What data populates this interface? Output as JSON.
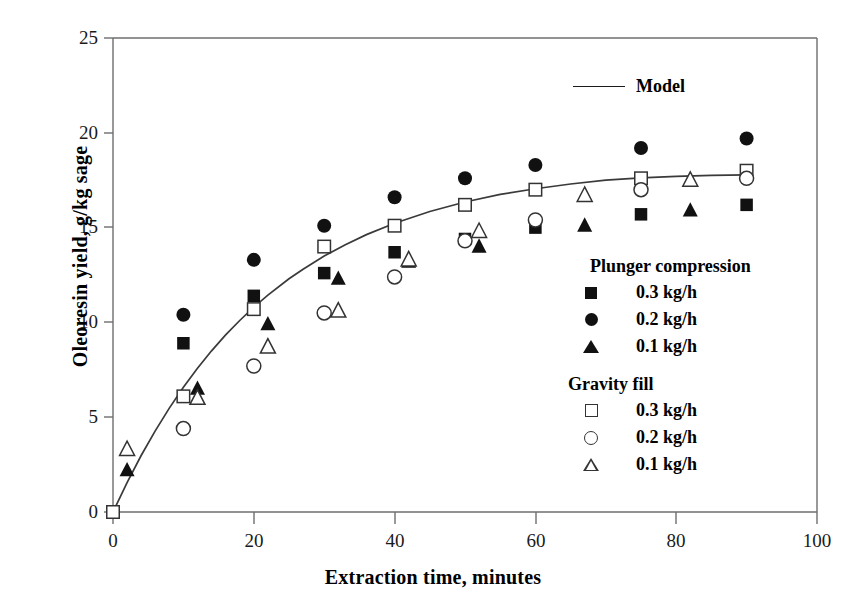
{
  "chart_data": {
    "type": "scatter",
    "title": "",
    "xlabel": "Extraction time, minutes",
    "ylabel": "Oleoresin yield, g/kg sage",
    "xlim": [
      0,
      100
    ],
    "ylim": [
      0,
      25
    ],
    "xticks": [
      0,
      20,
      40,
      60,
      80,
      100
    ],
    "yticks": [
      0,
      5,
      10,
      15,
      20,
      25
    ],
    "grid": false,
    "legend_position": "right-inside",
    "series": [
      {
        "name": "Model",
        "marker": "line",
        "style": "solid-line",
        "x": [
          0,
          2,
          4,
          6,
          8,
          10,
          12,
          14,
          16,
          18,
          20,
          22,
          25,
          27,
          30,
          33,
          36,
          40,
          45,
          50,
          55,
          60,
          65,
          70,
          75,
          80,
          85,
          90
        ],
        "y": [
          0.0,
          1.55,
          2.98,
          4.28,
          5.48,
          6.58,
          7.58,
          8.5,
          9.34,
          10.1,
          10.8,
          11.44,
          12.3,
          12.8,
          13.5,
          14.1,
          14.63,
          15.23,
          15.85,
          16.35,
          16.75,
          17.05,
          17.3,
          17.5,
          17.62,
          17.7,
          17.75,
          17.78
        ]
      },
      {
        "name": "Plunger compression 0.3 kg/h",
        "marker": "filled-square",
        "x": [
          10,
          20,
          30,
          40,
          50,
          60,
          75,
          90
        ],
        "y": [
          8.9,
          11.4,
          12.6,
          13.7,
          14.4,
          15.0,
          15.7,
          16.2
        ]
      },
      {
        "name": "Plunger compression 0.2 kg/h",
        "marker": "filled-circle",
        "x": [
          10,
          20,
          30,
          40,
          50,
          60,
          75,
          90
        ],
        "y": [
          10.4,
          13.3,
          15.1,
          16.6,
          17.6,
          18.3,
          19.2,
          19.7
        ]
      },
      {
        "name": "Plunger compression 0.1 kg/h",
        "marker": "filled-triangle",
        "x": [
          2,
          12,
          22,
          32,
          42,
          52,
          67,
          82
        ],
        "y": [
          2.2,
          6.5,
          9.9,
          12.3,
          13.2,
          14.0,
          15.1,
          15.9
        ]
      },
      {
        "name": "Gravity fill 0.3 kg/h",
        "marker": "open-square",
        "x": [
          0,
          10,
          20,
          30,
          40,
          50,
          60,
          75,
          90
        ],
        "y": [
          0.0,
          6.1,
          10.7,
          14.0,
          15.1,
          16.2,
          17.0,
          17.6,
          18.0
        ]
      },
      {
        "name": "Gravity fill 0.2 kg/h",
        "marker": "open-circle",
        "x": [
          10,
          20,
          30,
          40,
          50,
          60,
          75,
          90
        ],
        "y": [
          4.4,
          7.7,
          10.5,
          12.4,
          14.3,
          15.4,
          17.0,
          17.6
        ]
      },
      {
        "name": "Gravity fill 0.1 kg/h",
        "marker": "open-triangle",
        "x": [
          2,
          12,
          22,
          32,
          42,
          52,
          67,
          82
        ],
        "y": [
          3.3,
          6.0,
          8.7,
          10.6,
          13.3,
          14.8,
          16.7,
          17.5
        ]
      }
    ]
  },
  "axes": {
    "xlabel": "Extraction time, minutes",
    "ylabel": "Oleoresin yield, g/kg sage",
    "xticks": [
      "0",
      "20",
      "40",
      "60",
      "80",
      "100"
    ],
    "yticks": [
      "25",
      "20",
      "15",
      "10",
      "5",
      "0"
    ]
  },
  "legend": {
    "model": {
      "label": "Model",
      "swatch": "line-swatch"
    },
    "groups": [
      {
        "title": "Plunger compression",
        "items": [
          {
            "label": "0.3 kg/h",
            "marker": "filled-square-icon"
          },
          {
            "label": "0.2 kg/h",
            "marker": "filled-circle-icon"
          },
          {
            "label": "0.1 kg/h",
            "marker": "filled-triangle-icon"
          }
        ]
      },
      {
        "title": "Gravity fill",
        "items": [
          {
            "label": "0.3 kg/h",
            "marker": "open-square-icon"
          },
          {
            "label": "0.2 kg/h",
            "marker": "open-circle-icon"
          },
          {
            "label": "0.1 kg/h",
            "marker": "open-triangle-icon"
          }
        ]
      }
    ]
  },
  "colors": {
    "axis": "#555555",
    "marker_fill": "#111111",
    "marker_stroke": "#333333",
    "curve": "#333333",
    "background": "#ffffff"
  }
}
